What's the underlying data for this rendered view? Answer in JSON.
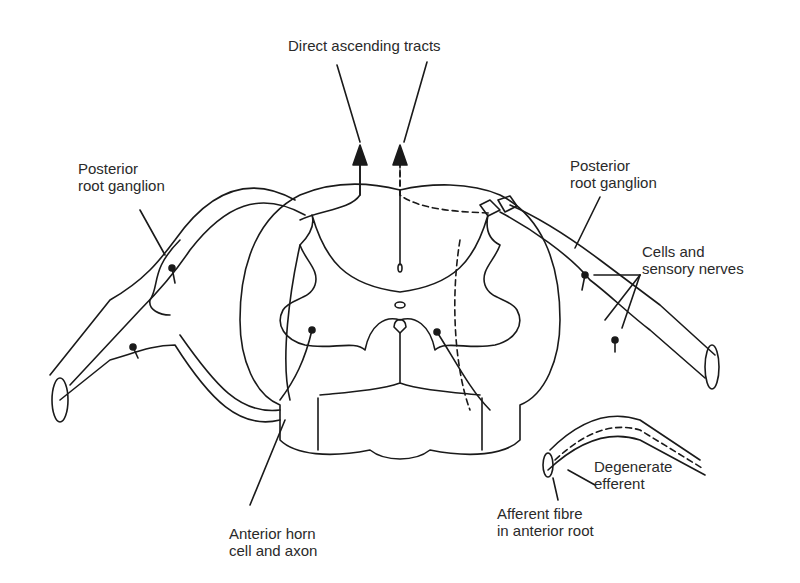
{
  "labels": {
    "top": "Direct ascending tracts",
    "left_ganglion": [
      "Posterior",
      "root ganglion"
    ],
    "right_ganglion": [
      "Posterior",
      "root ganglion"
    ],
    "cells": [
      "Cells and",
      "sensory nerves"
    ],
    "degenerate": [
      "Degenerate",
      "efferent"
    ],
    "afferent": [
      "Afferent fibre",
      "in anterior root"
    ],
    "anterior_horn": [
      "Anterior horn",
      "cell and axon"
    ]
  },
  "colors": {
    "line": "#1a1a1a",
    "background": "#ffffff"
  }
}
